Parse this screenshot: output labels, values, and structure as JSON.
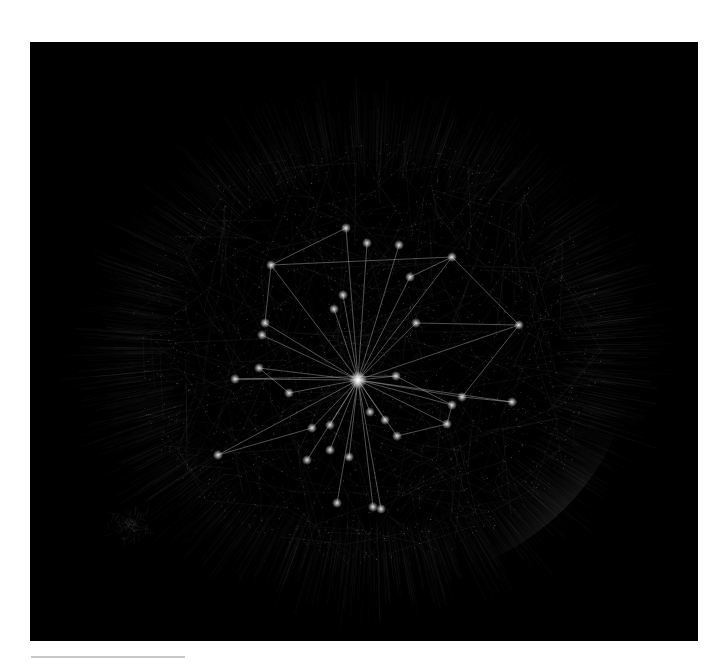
{
  "figure": {
    "type": "network-graph",
    "background": "#000000",
    "panel": {
      "x": 30,
      "y": 42,
      "width": 668,
      "height": 599
    },
    "cloud": {
      "center": [
        370,
        350
      ],
      "radius_x": 250,
      "radius_y": 225,
      "edge_color": "#8a8a8a",
      "fill_color": "#3a3a3a",
      "satellite_cluster": {
        "center": [
          130,
          525
        ],
        "radius": 22
      }
    },
    "highlight": {
      "edge_color": "#cfcfcf",
      "node_color": "#e6e6e6",
      "hub": {
        "id": "hub",
        "x": 358,
        "y": 380,
        "r": 3.2
      },
      "nodes": [
        {
          "id": "n1",
          "x": 271,
          "y": 265
        },
        {
          "id": "n2",
          "x": 346,
          "y": 228
        },
        {
          "id": "n3",
          "x": 367,
          "y": 243
        },
        {
          "id": "n4",
          "x": 399,
          "y": 245
        },
        {
          "id": "n5",
          "x": 452,
          "y": 257
        },
        {
          "id": "n6",
          "x": 410,
          "y": 277
        },
        {
          "id": "n7",
          "x": 343,
          "y": 295
        },
        {
          "id": "n8",
          "x": 334,
          "y": 309
        },
        {
          "id": "n9",
          "x": 416,
          "y": 323
        },
        {
          "id": "n10",
          "x": 519,
          "y": 325
        },
        {
          "id": "n11",
          "x": 265,
          "y": 323
        },
        {
          "id": "n12",
          "x": 262,
          "y": 335
        },
        {
          "id": "n13",
          "x": 259,
          "y": 368
        },
        {
          "id": "n14",
          "x": 235,
          "y": 379
        },
        {
          "id": "n15",
          "x": 289,
          "y": 393
        },
        {
          "id": "n16",
          "x": 396,
          "y": 376
        },
        {
          "id": "n17",
          "x": 462,
          "y": 397
        },
        {
          "id": "n18",
          "x": 512,
          "y": 402
        },
        {
          "id": "n19",
          "x": 452,
          "y": 405
        },
        {
          "id": "n20",
          "x": 447,
          "y": 424
        },
        {
          "id": "n21",
          "x": 397,
          "y": 436
        },
        {
          "id": "n22",
          "x": 312,
          "y": 428
        },
        {
          "id": "n23",
          "x": 330,
          "y": 425
        },
        {
          "id": "n24",
          "x": 330,
          "y": 450
        },
        {
          "id": "n25",
          "x": 349,
          "y": 457
        },
        {
          "id": "n26",
          "x": 307,
          "y": 460
        },
        {
          "id": "n27",
          "x": 218,
          "y": 455
        },
        {
          "id": "n28",
          "x": 337,
          "y": 503
        },
        {
          "id": "n29",
          "x": 373,
          "y": 507
        },
        {
          "id": "n30",
          "x": 381,
          "y": 509
        },
        {
          "id": "n31",
          "x": 385,
          "y": 420
        },
        {
          "id": "n32",
          "x": 370,
          "y": 412
        }
      ],
      "edges": [
        [
          "hub",
          "n1"
        ],
        [
          "hub",
          "n2"
        ],
        [
          "hub",
          "n3"
        ],
        [
          "hub",
          "n4"
        ],
        [
          "hub",
          "n5"
        ],
        [
          "hub",
          "n6"
        ],
        [
          "hub",
          "n7"
        ],
        [
          "hub",
          "n8"
        ],
        [
          "hub",
          "n9"
        ],
        [
          "hub",
          "n10"
        ],
        [
          "hub",
          "n11"
        ],
        [
          "hub",
          "n12"
        ],
        [
          "hub",
          "n13"
        ],
        [
          "hub",
          "n14"
        ],
        [
          "hub",
          "n15"
        ],
        [
          "hub",
          "n16"
        ],
        [
          "hub",
          "n17"
        ],
        [
          "hub",
          "n18"
        ],
        [
          "hub",
          "n19"
        ],
        [
          "hub",
          "n20"
        ],
        [
          "hub",
          "n21"
        ],
        [
          "hub",
          "n22"
        ],
        [
          "hub",
          "n23"
        ],
        [
          "hub",
          "n24"
        ],
        [
          "hub",
          "n25"
        ],
        [
          "hub",
          "n26"
        ],
        [
          "hub",
          "n27"
        ],
        [
          "hub",
          "n28"
        ],
        [
          "hub",
          "n29"
        ],
        [
          "hub",
          "n30"
        ],
        [
          "hub",
          "n31"
        ],
        [
          "hub",
          "n32"
        ],
        [
          "n1",
          "n2"
        ],
        [
          "n1",
          "n11"
        ],
        [
          "n1",
          "n5"
        ],
        [
          "n5",
          "n10"
        ],
        [
          "n10",
          "n17"
        ],
        [
          "n17",
          "n18"
        ],
        [
          "n14",
          "n16"
        ],
        [
          "n16",
          "n19"
        ],
        [
          "n19",
          "n20"
        ],
        [
          "n20",
          "n21"
        ],
        [
          "n9",
          "n10"
        ],
        [
          "n5",
          "n6"
        ],
        [
          "n13",
          "n15"
        ],
        [
          "n22",
          "n27"
        ]
      ]
    }
  },
  "caption_rule": {
    "color": "#c8c8c8"
  }
}
